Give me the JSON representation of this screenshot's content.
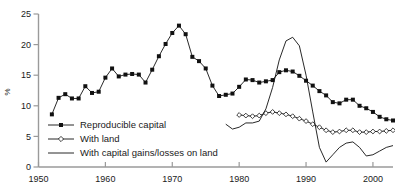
{
  "chart_data": {
    "type": "line",
    "title": "",
    "xlabel": "",
    "ylabel": "%",
    "xlim": [
      1950,
      2003
    ],
    "ylim": [
      0,
      25
    ],
    "ytick_labels": [
      "0",
      "5",
      "10",
      "15",
      "20",
      "25"
    ],
    "yticks": [
      0,
      5,
      10,
      15,
      20,
      25
    ],
    "xtick_labels": [
      "1950",
      "1960",
      "1970",
      "1980",
      "1990",
      "2000"
    ],
    "xticks": [
      1950,
      1960,
      1970,
      1980,
      1990,
      2000
    ],
    "grid": false,
    "legend_position": "lower-left-inside",
    "series": [
      {
        "name": "Reproducible capital",
        "marker": "filled-square",
        "x": [
          1952,
          1953,
          1954,
          1955,
          1956,
          1957,
          1958,
          1959,
          1960,
          1961,
          1962,
          1963,
          1964,
          1965,
          1966,
          1967,
          1968,
          1969,
          1970,
          1971,
          1972,
          1973,
          1974,
          1975,
          1976,
          1977,
          1978,
          1979,
          1980,
          1981,
          1982,
          1983,
          1984,
          1985,
          1986,
          1987,
          1988,
          1989,
          1990,
          1991,
          1992,
          1993,
          1994,
          1995,
          1996,
          1997,
          1998,
          1999,
          2000,
          2001,
          2002,
          2003
        ],
        "values": [
          8.6,
          11.3,
          11.9,
          11.2,
          11.2,
          13.2,
          12.1,
          12.3,
          14.6,
          16.1,
          14.8,
          15.1,
          15.2,
          15.1,
          13.8,
          15.9,
          18.1,
          20.1,
          21.9,
          23.1,
          21.7,
          18.0,
          17.3,
          16.1,
          13.3,
          11.6,
          11.8,
          12.0,
          13.1,
          14.3,
          14.2,
          13.8,
          14.0,
          14.2,
          15.5,
          15.8,
          15.6,
          14.9,
          14.1,
          13.3,
          12.4,
          11.7,
          10.6,
          10.4,
          11.0,
          11.0,
          10.0,
          9.6,
          9.0,
          8.2,
          7.8,
          7.6
        ],
        "ylim_note": "percent of GDP"
      },
      {
        "name": "With land",
        "marker": "open-diamond",
        "x": [
          1980,
          1981,
          1982,
          1983,
          1984,
          1985,
          1986,
          1987,
          1988,
          1989,
          1990,
          1991,
          1992,
          1993,
          1994,
          1995,
          1996,
          1997,
          1998,
          1999,
          2000,
          2001,
          2002,
          2003
        ],
        "values": [
          8.5,
          8.4,
          8.3,
          8.4,
          8.8,
          9.0,
          8.8,
          8.6,
          8.3,
          7.9,
          7.5,
          7.0,
          6.5,
          6.0,
          5.7,
          5.8,
          6.0,
          6.0,
          5.7,
          5.7,
          5.8,
          5.8,
          5.9,
          6.0
        ]
      },
      {
        "name": "With capital gains/losses on land",
        "marker": "none",
        "x": [
          1978,
          1979,
          1980,
          1981,
          1982,
          1983,
          1984,
          1985,
          1986,
          1987,
          1988,
          1989,
          1990,
          1991,
          1992,
          1993,
          1994,
          1995,
          1996,
          1997,
          1998,
          1999,
          2000,
          2001,
          2002,
          2003
        ],
        "values": [
          7.0,
          6.2,
          6.5,
          7.2,
          7.2,
          7.5,
          9.5,
          13.0,
          17.5,
          20.6,
          21.2,
          19.8,
          15.0,
          9.0,
          3.2,
          0.8,
          2.0,
          3.2,
          3.9,
          4.1,
          3.2,
          1.8,
          2.0,
          2.6,
          3.2,
          3.5
        ]
      }
    ]
  },
  "legend": {
    "items": [
      {
        "label": "Reproducible capital"
      },
      {
        "label": "With land"
      },
      {
        "label": "With capital gains/losses on land"
      }
    ]
  }
}
